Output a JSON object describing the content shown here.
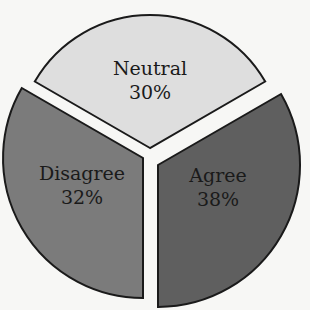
{
  "chart_data": {
    "type": "pie",
    "title": "",
    "exploded": true,
    "categories": [
      "Neutral",
      "Agree",
      "Disagree"
    ],
    "values": [
      30,
      38,
      32
    ],
    "labels": [
      "30%",
      "38%",
      "32%"
    ],
    "colors": [
      "#dedede",
      "#5f5f5f",
      "#7b7b7b"
    ],
    "legend": "none",
    "slices": [
      {
        "name": "Neutral",
        "value": 30,
        "pct": "30%",
        "color": "#dedede",
        "cx": 150,
        "cy": 148,
        "r": 133,
        "start": -150,
        "end": -30,
        "lx": 150,
        "ly": 75
      },
      {
        "name": "Agree",
        "value": 38,
        "pct": "38%",
        "color": "#5f5f5f",
        "cx": 158,
        "cy": 165,
        "r": 142,
        "start": -30,
        "end": 90,
        "lx": 218,
        "ly": 182
      },
      {
        "name": "Disagree",
        "value": 32,
        "pct": "32%",
        "color": "#7b7b7b",
        "cx": 143,
        "cy": 158,
        "r": 140,
        "start": 90,
        "end": 210,
        "lx": 82,
        "ly": 180
      }
    ]
  }
}
